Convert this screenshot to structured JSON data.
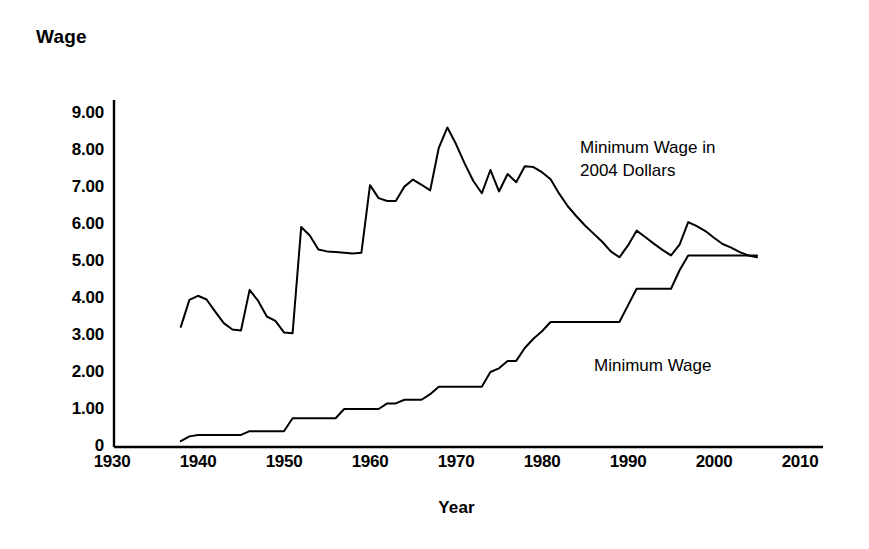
{
  "chart_data": {
    "type": "line",
    "title": "",
    "xlabel": "Year",
    "ylabel": "Wage",
    "xlim": [
      1930,
      2010
    ],
    "ylim": [
      0,
      9
    ],
    "grid": false,
    "legend_position": "inline-annotations",
    "xticks": [
      "1930",
      "1940",
      "1950",
      "1960",
      "1970",
      "1980",
      "1990",
      "2000",
      "2010"
    ],
    "yticks": [
      "0",
      "1.00",
      "2.00",
      "3.00",
      "4.00",
      "5.00",
      "6.00",
      "7.00",
      "8.00",
      "9.00"
    ],
    "annotations": [
      {
        "id": "real-series-label",
        "text": "Minimum Wage in\n2004 Dollars"
      },
      {
        "id": "nominal-series-label",
        "text": "Minimum Wage"
      }
    ],
    "series": [
      {
        "name": "Minimum Wage in 2004 Dollars",
        "color": "#000000",
        "x": [
          1938,
          1939,
          1940,
          1941,
          1942,
          1943,
          1944,
          1945,
          1946,
          1947,
          1948,
          1949,
          1950,
          1951,
          1952,
          1953,
          1954,
          1955,
          1956,
          1957,
          1958,
          1959,
          1960,
          1961,
          1962,
          1963,
          1964,
          1965,
          1966,
          1967,
          1968,
          1969,
          1970,
          1971,
          1972,
          1973,
          1974,
          1975,
          1976,
          1977,
          1978,
          1979,
          1980,
          1981,
          1982,
          1983,
          1984,
          1985,
          1986,
          1987,
          1988,
          1989,
          1990,
          1991,
          1992,
          1993,
          1994,
          1995,
          1996,
          1997,
          1998,
          1999,
          2000,
          2001,
          2002,
          2003,
          2004,
          2005
        ],
        "y": [
          3.22,
          3.95,
          4.06,
          3.96,
          3.63,
          3.32,
          3.15,
          3.12,
          4.22,
          3.92,
          3.5,
          3.38,
          3.07,
          3.05,
          5.92,
          5.69,
          5.31,
          5.26,
          5.24,
          5.22,
          5.2,
          5.22,
          7.05,
          6.7,
          6.62,
          6.62,
          7.01,
          7.2,
          7.06,
          6.91,
          8.06,
          8.61,
          8.16,
          7.64,
          7.17,
          6.83,
          7.46,
          6.88,
          7.35,
          7.13,
          7.56,
          7.54,
          7.4,
          7.21,
          6.82,
          6.48,
          6.21,
          5.96,
          5.74,
          5.52,
          5.26,
          5.1,
          5.42,
          5.82,
          5.65,
          5.47,
          5.3,
          5.15,
          5.44,
          6.05,
          5.94,
          5.81,
          5.63,
          5.46,
          5.36,
          5.24,
          5.15,
          5.1
        ]
      },
      {
        "name": "Minimum Wage",
        "color": "#000000",
        "x": [
          1938,
          1939,
          1940,
          1941,
          1942,
          1943,
          1944,
          1945,
          1946,
          1947,
          1948,
          1949,
          1950,
          1951,
          1952,
          1953,
          1954,
          1955,
          1956,
          1957,
          1958,
          1959,
          1960,
          1961,
          1962,
          1963,
          1964,
          1965,
          1966,
          1967,
          1968,
          1969,
          1970,
          1971,
          1972,
          1973,
          1974,
          1975,
          1976,
          1977,
          1978,
          1979,
          1980,
          1981,
          1982,
          1983,
          1984,
          1985,
          1986,
          1987,
          1988,
          1989,
          1990,
          1991,
          1992,
          1993,
          1994,
          1995,
          1996,
          1997,
          1998,
          1999,
          2000,
          2001,
          2002,
          2003,
          2004,
          2005
        ],
        "y": [
          0.13,
          0.26,
          0.3,
          0.3,
          0.3,
          0.3,
          0.3,
          0.3,
          0.4,
          0.4,
          0.4,
          0.4,
          0.4,
          0.75,
          0.75,
          0.75,
          0.75,
          0.75,
          0.75,
          1.0,
          1.0,
          1.0,
          1.0,
          1.0,
          1.15,
          1.15,
          1.25,
          1.25,
          1.25,
          1.4,
          1.6,
          1.6,
          1.6,
          1.6,
          1.6,
          1.6,
          2.0,
          2.1,
          2.3,
          2.3,
          2.65,
          2.9,
          3.1,
          3.35,
          3.35,
          3.35,
          3.35,
          3.35,
          3.35,
          3.35,
          3.35,
          3.35,
          3.8,
          4.25,
          4.25,
          4.25,
          4.25,
          4.25,
          4.75,
          5.15,
          5.15,
          5.15,
          5.15,
          5.15,
          5.15,
          5.15,
          5.15,
          5.15
        ]
      }
    ]
  },
  "axes": {
    "y_title": "Wage",
    "x_title": "Year"
  }
}
